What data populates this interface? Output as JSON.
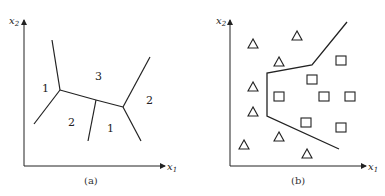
{
  "figure": {
    "panel_a": {
      "caption": "(a)",
      "x_axis_label": "x",
      "x_axis_sub": "1",
      "y_axis_label": "x",
      "y_axis_sub": "2",
      "region_labels": [
        {
          "text": "1",
          "x": 45,
          "y": 92
        },
        {
          "text": "3",
          "x": 98,
          "y": 80
        },
        {
          "text": "2",
          "x": 71,
          "y": 126
        },
        {
          "text": "1",
          "x": 110,
          "y": 132
        },
        {
          "text": "2",
          "x": 149,
          "y": 104
        }
      ]
    },
    "panel_b": {
      "caption": "(b)",
      "x_axis_label": "x",
      "x_axis_sub": "1",
      "y_axis_label": "x",
      "y_axis_sub": "2",
      "class_triangle": "triangle",
      "class_square": "square"
    },
    "line_color": "#222222"
  }
}
